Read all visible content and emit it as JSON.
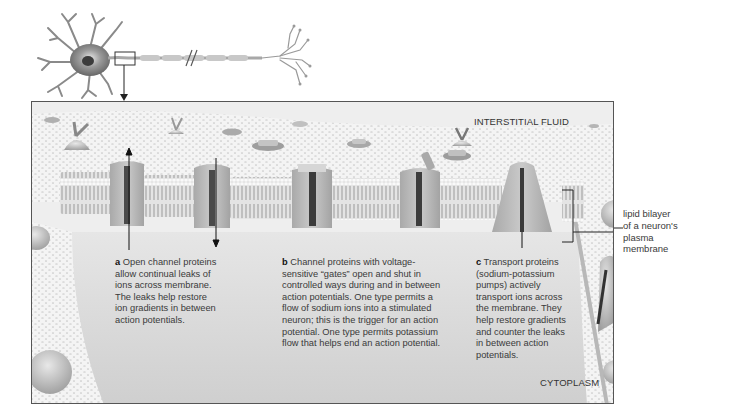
{
  "figure": {
    "overview": {
      "subject": "neuron",
      "inset_marker": "box-on-axon-near-soma",
      "axon_break_symbol": "//"
    },
    "regions": {
      "top": "INTERSTITIAL FLUID",
      "bottom": "CYTOPLASM"
    },
    "side_label": {
      "lines": [
        "lipid bilayer",
        "of a neuron's",
        "plasma",
        "membrane"
      ]
    },
    "captions": [
      {
        "letter": "a",
        "lines": [
          "Open channel proteins",
          "allow continual leaks of",
          "ions across membrane.",
          "The leaks help restore",
          "ion gradients in between",
          "action potentials."
        ]
      },
      {
        "letter": "b",
        "lines": [
          "Channel proteins with voltage-",
          "sensitive “gates” open and shut in",
          "controlled ways during and in between",
          "action potentials. One type permits a",
          "flow of sodium ions into a stimulated",
          "neuron; this is the trigger for an action",
          "potential. One type permits potassium",
          "flow that helps end an action potential."
        ]
      },
      {
        "letter": "c",
        "lines": [
          "Transport proteins",
          "(sodium-potassium",
          "pumps) actively",
          "transport ions across",
          "the membrane. They",
          "help restore gradients",
          "and counter the leaks",
          "in between action",
          "potentials."
        ]
      }
    ],
    "colors": {
      "membrane_surface": "#d9d9d9",
      "cytoplasm": "#dcdcdc",
      "protein": "#b5b5b5",
      "channel_pore": "#4a4a4a",
      "frame_border": "#555555"
    }
  }
}
